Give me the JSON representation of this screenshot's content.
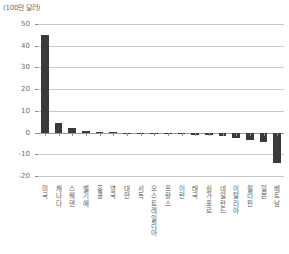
{
  "chart_data": {
    "type": "bar",
    "title": "",
    "unit_label": "(100만 달러)",
    "xlabel": "",
    "ylabel": "",
    "ylim": [
      -20,
      50
    ],
    "yticks": [
      50,
      40,
      30,
      20,
      10,
      0,
      -10,
      -20
    ],
    "ytick_labels": [
      "50",
      "40",
      "30",
      "20",
      "10",
      "0",
      "-10",
      "-20"
    ],
    "grid": true,
    "legend": "none",
    "bar_color": "#3a3a3a",
    "grid_color": "#c9c9c9",
    "axis_color": "#9a9a9a",
    "text_color": "#5a5a5a",
    "categories": [
      "미국",
      "캐나다",
      "스웨덴",
      "벨기에",
      "홍콩",
      "영국",
      "대만",
      "서독",
      "오스트레일리아",
      "프랑스",
      "이란",
      "태국",
      "싱가포르",
      "네덜란드",
      "이탈리아",
      "필리핀",
      "일본",
      "베트남"
    ],
    "values": [
      45.0,
      4.2,
      2.3,
      0.8,
      0.3,
      0.1,
      -0.2,
      -0.3,
      -0.5,
      -0.6,
      -0.7,
      -0.9,
      -1.0,
      -1.4,
      -2.6,
      -3.6,
      -4.4,
      -14.0
    ]
  }
}
